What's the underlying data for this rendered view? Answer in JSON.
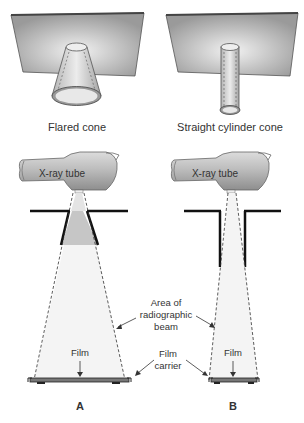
{
  "top": {
    "left_caption": "Flared cone",
    "right_caption": "Straight cylinder cone"
  },
  "bottom": {
    "left_tube_label": "X-ray tube",
    "right_tube_label": "X-ray tube",
    "beam_label_line1": "Area of",
    "beam_label_line2": "radiographic",
    "beam_label_line3": "beam",
    "film_left": "Film",
    "film_right": "Film",
    "carrier_line1": "Film",
    "carrier_line2": "carrier",
    "panel_a": "A",
    "panel_b": "B"
  }
}
